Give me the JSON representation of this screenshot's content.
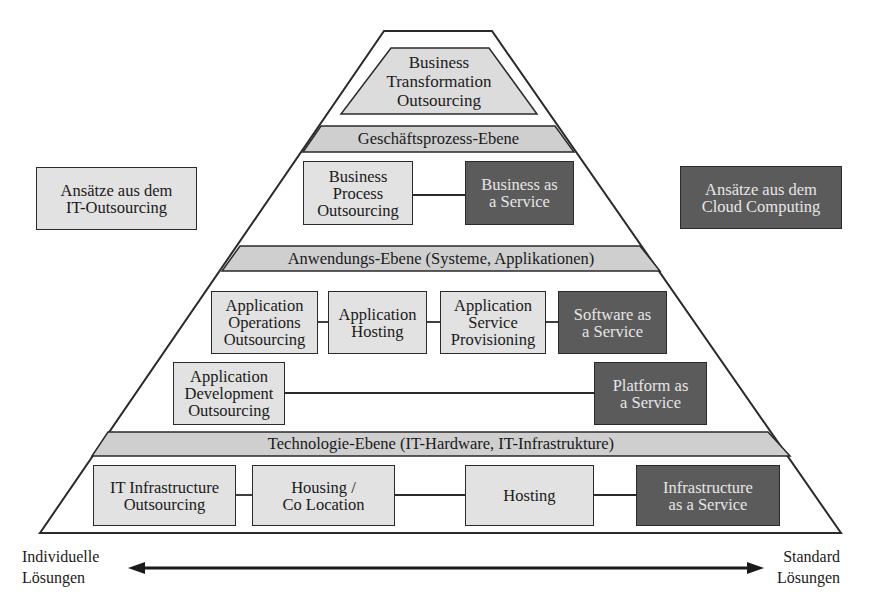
{
  "diagram": {
    "title": "",
    "colors": {
      "light_box": "#e2e2e2",
      "dark_box": "#5b5b5b",
      "band": "#cfcfcf",
      "line": "#2a2a2a"
    },
    "legend": {
      "it_outsourcing": "Ansätze aus dem\nIT-Outsourcing",
      "cloud_computing": "Ansätze aus dem\nCloud Computing"
    },
    "apex": {
      "label": "Business\nTransformation\nOutsourcing"
    },
    "bands": {
      "business_process": "Geschäftsprozess-Ebene",
      "application": "Anwendungs-Ebene (Systeme, Applikationen)",
      "technology": "Technologie-Ebene (IT-Hardware, IT-Infrastrukture)"
    },
    "business_row": {
      "outsourcing": "Business\nProcess\nOutsourcing",
      "cloud": "Business as\na Service"
    },
    "application_row_1": {
      "items": [
        "Application\nOperations\nOutsourcing",
        "Application\nHosting",
        "Application\nService\nProvisioning"
      ],
      "cloud": "Software as\na Service"
    },
    "application_row_2": {
      "outsourcing": "Application\nDevelopment\nOutsourcing",
      "cloud": "Platform as\na Service"
    },
    "technology_row": {
      "items": [
        "IT Infrastructure\nOutsourcing",
        "Housing /\nCo Location",
        "Hosting"
      ],
      "cloud": "Infrastructure\nas a Service"
    },
    "axis": {
      "left": "Individuelle\nLösungen",
      "right": "Standard\nLösungen"
    }
  }
}
